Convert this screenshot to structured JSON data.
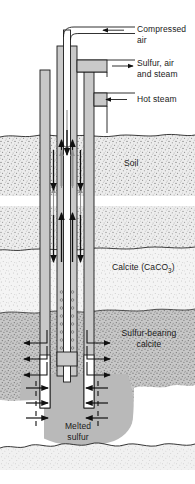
{
  "diagram": {
    "labels": {
      "compressed_air": "Compressed\nair",
      "sulfur_air_steam": "Sulfur, air\nand steam",
      "hot_steam": "Hot steam",
      "soil": "Soil",
      "calcite_prefix": "Calcite (CaCO",
      "calcite_sub": "3",
      "calcite_suffix": ")",
      "sulfur_bearing_calcite": "Sulfur-bearing\ncalcite",
      "melted_sulfur": "Melted\nsulfur"
    },
    "colors": {
      "pipe_fill": "#c9c9c9",
      "pipe_stroke": "#1a1a1a",
      "soil_fill": "#e9e9e9",
      "calcite_fill": "#f2f2f2",
      "sulfur_calcite_fill": "#c2c2c2",
      "melted_sulfur_fill": "#b5b5b5",
      "bedrock_fill": "#efefef",
      "arrow": "#1a1a1a",
      "flow_arrow_gray": "#8f8f8f",
      "background": "#ffffff"
    },
    "layers": [
      {
        "name": "soil",
        "label": "Soil",
        "top": 135,
        "bottom": 196
      },
      {
        "name": "calcite",
        "label": "Calcite (CaCO3)",
        "top": 206,
        "bottom": 312
      },
      {
        "name": "sulfur-bearing-calcite",
        "label": "Sulfur-bearing calcite",
        "top": 312,
        "bottom": 400
      },
      {
        "name": "melted-sulfur",
        "label": "Melted sulfur",
        "top": 375,
        "bottom": 443
      },
      {
        "name": "bedrock",
        "label": "",
        "top": 443,
        "bottom": 470
      }
    ],
    "flows": [
      {
        "name": "compressed-air",
        "direction": "left",
        "label": "Compressed air"
      },
      {
        "name": "sulfur-air-steam",
        "direction": "right",
        "label": "Sulfur, air and steam"
      },
      {
        "name": "hot-steam",
        "direction": "left",
        "label": "Hot steam"
      }
    ]
  }
}
